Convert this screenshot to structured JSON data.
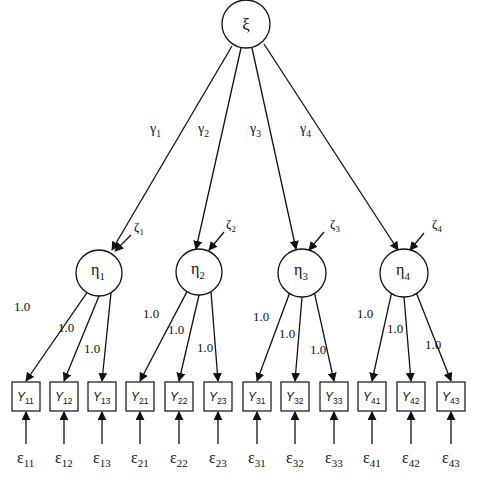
{
  "diagram": {
    "type": "structural-equation-model",
    "exogenous": {
      "id": "xi",
      "label": "ξ",
      "cx": 246,
      "cy": 24,
      "r": 24
    },
    "endogenous": [
      {
        "id": "eta1",
        "label": "η",
        "sub": "1",
        "cx": 99,
        "cy": 273,
        "r": 23,
        "gamma": {
          "label": "γ",
          "sub": "1",
          "lx": 150,
          "ly": 133,
          "x1": 232,
          "y1": 46,
          "x2": 112,
          "y2": 250
        },
        "zeta": {
          "label": "ζ",
          "sub": "1",
          "lx": 134,
          "ly": 231,
          "x1": 131,
          "y1": 235,
          "x2": 115,
          "y2": 251
        },
        "indicators": [
          {
            "label": "Y",
            "sub": "11",
            "box_x": 12,
            "error": {
              "label": "ε",
              "sub": "11"
            },
            "loading": "1.0",
            "llx": 14,
            "lly": 311
          },
          {
            "label": "Y",
            "sub": "12",
            "box_x": 50,
            "error": {
              "label": "ε",
              "sub": "12"
            },
            "loading": "1.0",
            "llx": 58,
            "lly": 332
          },
          {
            "label": "Y",
            "sub": "13",
            "box_x": 88,
            "error": {
              "label": "ε",
              "sub": "13"
            },
            "loading": "1.0",
            "llx": 84,
            "lly": 353
          }
        ]
      },
      {
        "id": "eta2",
        "label": "η",
        "sub": "2",
        "cx": 199,
        "cy": 272,
        "r": 23,
        "gamma": {
          "label": "γ",
          "sub": "2",
          "lx": 198,
          "ly": 133,
          "x1": 241,
          "y1": 48,
          "x2": 196,
          "y2": 249
        },
        "zeta": {
          "label": "ζ",
          "sub": "2",
          "lx": 226,
          "ly": 228,
          "x1": 224,
          "y1": 232,
          "x2": 209,
          "y2": 250
        },
        "indicators": [
          {
            "label": "Y",
            "sub": "21",
            "box_x": 126,
            "error": {
              "label": "ε",
              "sub": "21"
            },
            "loading": "1.0",
            "llx": 143,
            "lly": 318
          },
          {
            "label": "Y",
            "sub": "22",
            "box_x": 165,
            "error": {
              "label": "ε",
              "sub": "22"
            },
            "loading": "1.0",
            "llx": 168,
            "lly": 334
          },
          {
            "label": "Y",
            "sub": "23",
            "box_x": 204,
            "error": {
              "label": "ε",
              "sub": "23"
            },
            "loading": "1.0",
            "llx": 197,
            "lly": 352
          }
        ]
      },
      {
        "id": "eta3",
        "label": "η",
        "sub": "3",
        "cx": 302,
        "cy": 273,
        "r": 24,
        "gamma": {
          "label": "γ",
          "sub": "3",
          "lx": 250,
          "ly": 133,
          "x1": 252,
          "y1": 48,
          "x2": 296,
          "y2": 249
        },
        "zeta": {
          "label": "ζ",
          "sub": "3",
          "lx": 330,
          "ly": 228,
          "x1": 324,
          "y1": 232,
          "x2": 309,
          "y2": 250
        },
        "indicators": [
          {
            "label": "Y",
            "sub": "31",
            "box_x": 243,
            "error": {
              "label": "ε",
              "sub": "31"
            },
            "loading": "1.0",
            "llx": 253,
            "lly": 321
          },
          {
            "label": "Y",
            "sub": "32",
            "box_x": 281,
            "error": {
              "label": "ε",
              "sub": "32"
            },
            "loading": "1.0",
            "llx": 279,
            "lly": 338
          },
          {
            "label": "Y",
            "sub": "33",
            "box_x": 320,
            "error": {
              "label": "ε",
              "sub": "33"
            },
            "loading": "1.0",
            "llx": 310,
            "lly": 354
          }
        ]
      },
      {
        "id": "eta4",
        "label": "η",
        "sub": "4",
        "cx": 404,
        "cy": 273,
        "r": 24,
        "gamma": {
          "label": "γ",
          "sub": "4",
          "lx": 300,
          "ly": 133,
          "x1": 264,
          "y1": 44,
          "x2": 398,
          "y2": 250
        },
        "zeta": {
          "label": "ζ",
          "sub": "4",
          "lx": 432,
          "ly": 228,
          "x1": 424,
          "y1": 233,
          "x2": 410,
          "y2": 250
        },
        "indicators": [
          {
            "label": "Y",
            "sub": "41",
            "box_x": 358,
            "error": {
              "label": "ε",
              "sub": "41"
            },
            "loading": "1.0",
            "llx": 357,
            "lly": 318
          },
          {
            "label": "Y",
            "sub": "42",
            "box_x": 397,
            "error": {
              "label": "ε",
              "sub": "42"
            },
            "loading": "1.0",
            "llx": 387,
            "lly": 333
          },
          {
            "label": "Y",
            "sub": "43",
            "box_x": 437,
            "error": {
              "label": "ε",
              "sub": "43"
            },
            "loading": "1.0",
            "llx": 425,
            "lly": 349
          }
        ]
      }
    ],
    "layout": {
      "box_y": 382,
      "box_w": 28,
      "box_h": 29,
      "error_line_bottom": 444,
      "error_label_y": 463
    },
    "colors": {
      "stroke": "#111111",
      "background": "#ffffff"
    }
  }
}
